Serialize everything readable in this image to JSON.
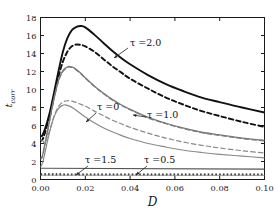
{
  "figure": {
    "background": "#ffffff",
    "axis_color": "#1a1a1a",
    "width": 280,
    "height": 216
  },
  "axes": {
    "x_label": "D",
    "y_label_main": "t",
    "y_label_sub": "corr",
    "x_ticks": [
      "0.00",
      "0.02",
      "0.04",
      "0.06",
      "0.08",
      "0.10"
    ],
    "y_ticks": [
      "0",
      "2",
      "4",
      "6",
      "8",
      "10",
      "12",
      "14",
      "16",
      "18"
    ]
  },
  "annotations": [
    {
      "id": "tau-2p0",
      "text": "τ =2.0",
      "x": 130,
      "y": 46
    },
    {
      "id": "tau-0",
      "text": "τ =0",
      "x": 97,
      "y": 110
    },
    {
      "id": "tau-1p0",
      "text": "τ =1.0",
      "x": 147,
      "y": 118
    },
    {
      "id": "tau-1p5",
      "text": "τ =1.5",
      "x": 85,
      "y": 163
    },
    {
      "id": "tau-0p5",
      "text": "τ =0.5",
      "x": 144,
      "y": 163
    }
  ],
  "chart_data": {
    "type": "line",
    "title": "",
    "xlabel": "D",
    "ylabel": "t_corr",
    "xlim": [
      0.0,
      0.1
    ],
    "ylim": [
      0.0,
      18.0
    ],
    "grid": false,
    "legend": "inline-annotations",
    "x_ticks": [
      0.0,
      0.02,
      0.04,
      0.06,
      0.08,
      0.1
    ],
    "y_ticks": [
      0,
      2,
      4,
      6,
      8,
      10,
      12,
      14,
      16,
      18
    ],
    "series": [
      {
        "name": "τ =2.0 (solid)",
        "style": "solid",
        "color": "#111111",
        "width": 1.9,
        "annotation": "τ =2.0",
        "x": [
          0.0,
          0.0008,
          0.002,
          0.004,
          0.006,
          0.008,
          0.01,
          0.012,
          0.014,
          0.016,
          0.018,
          0.02,
          0.024,
          0.028,
          0.032,
          0.036,
          0.04,
          0.048,
          0.056,
          0.064,
          0.072,
          0.08,
          0.09,
          0.1
        ],
        "y": [
          4.8,
          4.9,
          5.6,
          7.3,
          9.6,
          12.0,
          14.2,
          15.7,
          16.6,
          16.95,
          17.05,
          16.9,
          16.1,
          15.2,
          14.3,
          13.5,
          12.8,
          11.6,
          10.6,
          9.8,
          9.1,
          8.6,
          8.0,
          7.45
        ]
      },
      {
        "name": "τ =2.0 (dashed)",
        "style": "dashed",
        "color": "#111111",
        "width": 1.9,
        "annotation": "τ =2.0",
        "x": [
          0.0,
          0.0008,
          0.002,
          0.004,
          0.006,
          0.008,
          0.01,
          0.012,
          0.014,
          0.016,
          0.018,
          0.02,
          0.024,
          0.028,
          0.032,
          0.036,
          0.04,
          0.048,
          0.056,
          0.064,
          0.072,
          0.08,
          0.09,
          0.1
        ],
        "y": [
          4.3,
          4.4,
          5.2,
          7.0,
          9.2,
          11.4,
          13.1,
          14.2,
          14.8,
          15.0,
          14.95,
          14.8,
          14.2,
          13.4,
          12.6,
          11.9,
          11.2,
          10.1,
          9.1,
          8.3,
          7.6,
          7.05,
          6.4,
          5.85
        ]
      },
      {
        "name": "τ =1.0 (solid)",
        "style": "solid",
        "color": "#7a7a7a",
        "width": 1.3,
        "annotation": "τ =1.0",
        "x": [
          0.0,
          0.0008,
          0.002,
          0.004,
          0.006,
          0.008,
          0.01,
          0.012,
          0.013,
          0.015,
          0.018,
          0.02,
          0.024,
          0.028,
          0.032,
          0.036,
          0.04,
          0.048,
          0.056,
          0.064,
          0.072,
          0.08,
          0.09,
          0.1
        ],
        "y": [
          2.4,
          2.6,
          4.0,
          6.5,
          9.0,
          11.0,
          12.1,
          12.5,
          12.55,
          12.4,
          11.8,
          11.3,
          10.4,
          9.6,
          8.9,
          8.3,
          7.8,
          6.9,
          6.25,
          5.7,
          5.25,
          4.95,
          4.6,
          4.35
        ]
      },
      {
        "name": "τ =1.0 (dashed)",
        "style": "dashed",
        "color": "#7a7a7a",
        "width": 1.3,
        "annotation": "τ =1.0",
        "x": [
          0.0,
          0.0008,
          0.002,
          0.004,
          0.006,
          0.008,
          0.01,
          0.012,
          0.013,
          0.015,
          0.018,
          0.02,
          0.024,
          0.028,
          0.032,
          0.036,
          0.04,
          0.048,
          0.056,
          0.064,
          0.072,
          0.08,
          0.09,
          0.1
        ],
        "y": [
          2.3,
          2.5,
          3.9,
          6.4,
          8.9,
          10.9,
          12.0,
          12.45,
          12.5,
          12.35,
          11.75,
          11.25,
          10.35,
          9.55,
          8.85,
          8.25,
          7.75,
          6.85,
          6.2,
          5.65,
          5.2,
          4.9,
          4.55,
          4.3
        ]
      },
      {
        "name": "τ =0 (solid)",
        "style": "solid",
        "color": "#8a8a8a",
        "width": 1.2,
        "annotation": "τ =0",
        "x": [
          0.0,
          0.001,
          0.002,
          0.004,
          0.006,
          0.008,
          0.01,
          0.011,
          0.013,
          0.015,
          0.018,
          0.02,
          0.024,
          0.028,
          0.032,
          0.036,
          0.04,
          0.048,
          0.056,
          0.064,
          0.072,
          0.08,
          0.09,
          0.1
        ],
        "y": [
          1.4,
          1.9,
          3.0,
          5.2,
          6.9,
          7.9,
          8.25,
          8.3,
          8.15,
          7.85,
          7.3,
          6.95,
          6.3,
          5.75,
          5.3,
          4.9,
          4.55,
          4.0,
          3.6,
          3.25,
          3.0,
          2.8,
          2.6,
          2.4
        ]
      },
      {
        "name": "τ =0 (dashed)",
        "style": "dashed",
        "color": "#8a8a8a",
        "width": 1.2,
        "annotation": "τ =0",
        "x": [
          0.0,
          0.001,
          0.002,
          0.004,
          0.006,
          0.008,
          0.01,
          0.012,
          0.014,
          0.016,
          0.018,
          0.02,
          0.024,
          0.028,
          0.032,
          0.036,
          0.04,
          0.048,
          0.056,
          0.064,
          0.072,
          0.08,
          0.09,
          0.1
        ],
        "y": [
          4.4,
          4.3,
          4.1,
          5.4,
          7.0,
          8.1,
          8.6,
          8.75,
          8.7,
          8.55,
          8.35,
          8.15,
          7.6,
          7.1,
          6.6,
          6.2,
          5.8,
          5.15,
          4.6,
          4.15,
          3.8,
          3.5,
          3.2,
          2.95
        ]
      },
      {
        "name": "τ =1.5 (flat solid)",
        "style": "solid",
        "color": "#555555",
        "width": 1.1,
        "annotation": "τ =1.5",
        "x": [
          0.0,
          0.1
        ],
        "y": [
          1.25,
          1.15
        ]
      },
      {
        "name": "τ =0.5 (flat dotted)",
        "style": "dotted-thick",
        "color": "#222222",
        "width": 2.4,
        "annotation": "τ =0.5",
        "x": [
          0.0,
          0.1
        ],
        "y": [
          0.55,
          0.52
        ]
      },
      {
        "name": "τ =0.5 (flat solid underlay)",
        "style": "solid",
        "color": "#9a9a9a",
        "width": 1.0,
        "annotation": "τ =0.5",
        "x": [
          0.0,
          0.1
        ],
        "y": [
          0.48,
          0.46
        ]
      }
    ]
  }
}
